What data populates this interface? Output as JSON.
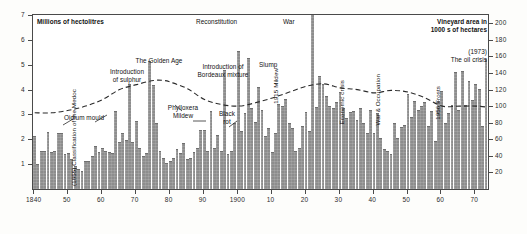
{
  "chart_data": {
    "type": "bar",
    "title": "",
    "left_axis": {
      "label": "Millions of hectolitres",
      "ticks": [
        1,
        2,
        3,
        4,
        5,
        6,
        7
      ],
      "ylim": [
        0,
        7
      ]
    },
    "right_axis": {
      "label": "Vineyard area in 1000 s of hectares",
      "ticks": [
        20,
        40,
        60,
        80,
        100,
        120,
        140,
        160,
        180,
        200
      ],
      "ylim": [
        0,
        210
      ]
    },
    "xlabel": "",
    "xlim": [
      1840,
      1973
    ],
    "xticks": [
      1840,
      1850,
      1860,
      1870,
      1880,
      1890,
      1900,
      1910,
      1920,
      1930,
      1940,
      1950,
      1960,
      1970
    ],
    "xtick_labels": [
      "1840",
      "50",
      "60",
      "70",
      "80",
      "90",
      "1900",
      "10",
      "20",
      "30",
      "40",
      "50",
      "60",
      "70"
    ],
    "grid": false,
    "legend": "none",
    "series": [
      {
        "name": "Production",
        "kind": "bar",
        "unit": "millions of hectolitres",
        "axis": "left",
        "x": [
          1840,
          1841,
          1842,
          1843,
          1844,
          1845,
          1846,
          1847,
          1848,
          1849,
          1850,
          1851,
          1852,
          1853,
          1854,
          1855,
          1856,
          1857,
          1858,
          1859,
          1860,
          1861,
          1862,
          1863,
          1864,
          1865,
          1866,
          1867,
          1868,
          1869,
          1870,
          1871,
          1872,
          1873,
          1874,
          1875,
          1876,
          1877,
          1878,
          1879,
          1880,
          1881,
          1882,
          1883,
          1884,
          1885,
          1886,
          1887,
          1888,
          1889,
          1890,
          1891,
          1892,
          1893,
          1894,
          1895,
          1896,
          1897,
          1898,
          1899,
          1900,
          1901,
          1902,
          1903,
          1904,
          1905,
          1906,
          1907,
          1908,
          1909,
          1910,
          1911,
          1912,
          1913,
          1914,
          1915,
          1916,
          1917,
          1918,
          1919,
          1920,
          1921,
          1922,
          1923,
          1924,
          1925,
          1926,
          1927,
          1928,
          1929,
          1930,
          1931,
          1932,
          1933,
          1934,
          1935,
          1936,
          1937,
          1938,
          1939,
          1940,
          1941,
          1942,
          1943,
          1944,
          1945,
          1946,
          1947,
          1948,
          1949,
          1950,
          1951,
          1952,
          1953,
          1954,
          1955,
          1956,
          1957,
          1958,
          1959,
          1960,
          1961,
          1962,
          1963,
          1964,
          1965,
          1966,
          1967,
          1968,
          1969,
          1970,
          1971,
          1972,
          1973
        ],
        "values": [
          2.1,
          0.95,
          1.5,
          1.5,
          2.25,
          1.45,
          1.5,
          2.2,
          2.2,
          1.35,
          1.4,
          1.15,
          0.9,
          0.75,
          0.7,
          1.1,
          1.1,
          1.3,
          1.7,
          1.45,
          1.6,
          1.5,
          1.45,
          1.4,
          3.1,
          1.85,
          2.2,
          1.95,
          4.2,
          1.85,
          2.7,
          1.6,
          1.3,
          1.4,
          5.1,
          4.15,
          2.6,
          1.5,
          1.2,
          1.0,
          1.1,
          1.2,
          1.55,
          1.4,
          1.8,
          1.15,
          1.2,
          1.45,
          1.6,
          2.35,
          2.35,
          1.5,
          3.1,
          1.6,
          2.15,
          1.5,
          4.75,
          1.35,
          1.5,
          2.6,
          5.5,
          2.3,
          3.0,
          5.25,
          3.2,
          2.65,
          4.05,
          3.15,
          2.1,
          2.4,
          1.45,
          2.2,
          3.4,
          3.3,
          3.6,
          2.6,
          2.4,
          1.5,
          1.6,
          2.5,
          3.05,
          2.3,
          7.0,
          3.25,
          4.5,
          4.2,
          3.7,
          3.3,
          3.2,
          3.45,
          3.85,
          3.2,
          2.8,
          3.05,
          3.1,
          2.75,
          3.2,
          2.6,
          2.2,
          3.15,
          2.2,
          3.0,
          2.0,
          1.55,
          1.5,
          1.35,
          2.6,
          2.0,
          2.45,
          2.55,
          3.8,
          2.85,
          3.5,
          3.15,
          3.3,
          3.45,
          2.5,
          3.1,
          1.9,
          3.5,
          3.9,
          2.6,
          3.0,
          3.35,
          4.65,
          3.15,
          4.7,
          3.35,
          4.3,
          3.55,
          4.2,
          4.0,
          2.5,
          5.2
        ]
      },
      {
        "name": "Vineyard area",
        "kind": "dashed-line",
        "unit": "1000 s of hectares",
        "axis": "right",
        "x": [
          1840,
          1845,
          1850,
          1855,
          1860,
          1865,
          1870,
          1875,
          1878,
          1880,
          1885,
          1890,
          1895,
          1900,
          1905,
          1910,
          1915,
          1920,
          1925,
          1930,
          1935,
          1940,
          1945,
          1950,
          1955,
          1960,
          1965,
          1970,
          1973
        ],
        "values": [
          92,
          92,
          95,
          100,
          108,
          120,
          126,
          131,
          131,
          129,
          121,
          108,
          102,
          100,
          104,
          110,
          117,
          124,
          127,
          122,
          120,
          116,
          119,
          117,
          110,
          100,
          100,
          100,
          99
        ]
      }
    ],
    "annotations": [
      {
        "text": "Millions of hectolitres",
        "bold": true,
        "orient": "horizontal"
      },
      {
        "text": "Vineyard area in\n1000 s of hectares",
        "bold": true,
        "orient": "horizontal"
      },
      {
        "text": "Reconstitution",
        "orient": "horizontal"
      },
      {
        "text": "War",
        "orient": "horizontal"
      },
      {
        "text": "The Golden Age",
        "orient": "horizontal"
      },
      {
        "text": "Introduction\nof sulphur",
        "orient": "horizontal"
      },
      {
        "text": "Introduction of\nBordeaux mixture",
        "orient": "horizontal"
      },
      {
        "text": "Slump",
        "orient": "horizontal"
      },
      {
        "text": "Oidium mould",
        "orient": "horizontal"
      },
      {
        "text": "Phylloxera\nMildew",
        "orient": "horizontal"
      },
      {
        "text": "Black\nrot",
        "orient": "horizontal"
      },
      {
        "text": "(1973)\nThe oil crisis",
        "orient": "horizontal"
      },
      {
        "text": "(1855) Classification\nof the Medoc",
        "orient": "vertical"
      },
      {
        "text": "1915 Mildew",
        "orient": "vertical"
      },
      {
        "text": "Economic crisis",
        "orient": "vertical"
      },
      {
        "text": "War & Occupation",
        "orient": "vertical"
      },
      {
        "text": "1956 Frosts",
        "orient": "vertical"
      }
    ]
  },
  "axes": {
    "left_ticks": [
      "7",
      "6",
      "5",
      "4",
      "3",
      "2",
      "1"
    ],
    "right_ticks": [
      "200",
      "180",
      "160",
      "140",
      "120",
      "100",
      "80",
      "60",
      "40",
      "20"
    ],
    "x_ticks": [
      "1840",
      "50",
      "60",
      "70",
      "80",
      "90",
      "1900",
      "10",
      "20",
      "30",
      "40",
      "50",
      "60",
      "70"
    ]
  },
  "labels": {
    "units_left": "Millions of hectolitres",
    "units_right": "Vineyard area in\n1000 s of hectares",
    "reconstitution": "Reconstitution",
    "war": "War",
    "golden_age": "The Golden Age",
    "sulphur": "Introduction\nof sulphur",
    "bordeaux_mixture": "Introduction of\nBordeaux mixture",
    "slump": "Slump",
    "oidium": "Oidium mould",
    "phylloxera": "Phylloxera\nMildew",
    "black_rot": "Black\nrot",
    "oil_crisis": "(1973)\nThe oil crisis",
    "medoc": "(1855) Classification\nof the Medoc",
    "mildew_1915": "1915 Mildew",
    "economic_crisis": "Economic crisis",
    "war_occupation": "War & Occupation",
    "frosts_1956": "1956 Frosts"
  },
  "colors": {
    "bar": "#8d8d8d",
    "line": "#2b2b2b",
    "frame": "#4a4a4a",
    "text": "#111111",
    "background": "#ffffff"
  }
}
